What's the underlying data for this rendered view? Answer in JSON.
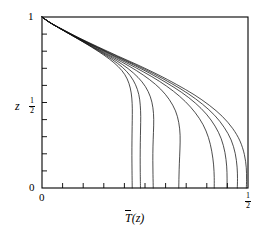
{
  "chart_data": {
    "type": "line",
    "title": "",
    "subtitle": "",
    "xlabel": "T̅(z)",
    "xlabel_parts": {
      "symbol": "T",
      "overbar": true,
      "arg": "(z)"
    },
    "ylabel": "z",
    "xlim": [
      0,
      0.5
    ],
    "ylim": [
      0,
      1
    ],
    "grid": false,
    "legend": false,
    "x_tick_labels": [
      "0",
      "1/2"
    ],
    "x_tick_values": [
      0,
      0.5
    ],
    "y_tick_labels": [
      "0",
      "1/2",
      "1"
    ],
    "y_tick_values": [
      0,
      0.5,
      1
    ],
    "x_minor_tick_count": 10,
    "y_minor_tick_count": 10,
    "series_count": 8,
    "series": [
      {
        "name": "curve-1",
        "x_end": 0.219,
        "points": [
          [
            0.0,
            1.0
          ],
          [
            0.018,
            0.97
          ],
          [
            0.042,
            0.935
          ],
          [
            0.072,
            0.893
          ],
          [
            0.104,
            0.848
          ],
          [
            0.136,
            0.8
          ],
          [
            0.163,
            0.755
          ],
          [
            0.185,
            0.71
          ],
          [
            0.201,
            0.663
          ],
          [
            0.211,
            0.612
          ],
          [
            0.2165,
            0.556
          ],
          [
            0.2188,
            0.495
          ],
          [
            0.2192,
            0.43
          ],
          [
            0.2188,
            0.36
          ],
          [
            0.2184,
            0.28
          ],
          [
            0.2182,
            0.19
          ],
          [
            0.2185,
            0.1
          ],
          [
            0.219,
            0.0
          ]
        ]
      },
      {
        "name": "curve-2",
        "x_end": 0.239,
        "points": [
          [
            0.0,
            1.0
          ],
          [
            0.018,
            0.97
          ],
          [
            0.042,
            0.935
          ],
          [
            0.073,
            0.892
          ],
          [
            0.106,
            0.846
          ],
          [
            0.14,
            0.798
          ],
          [
            0.17,
            0.752
          ],
          [
            0.195,
            0.706
          ],
          [
            0.214,
            0.657
          ],
          [
            0.227,
            0.604
          ],
          [
            0.235,
            0.546
          ],
          [
            0.2385,
            0.484
          ],
          [
            0.2396,
            0.418
          ],
          [
            0.2392,
            0.345
          ],
          [
            0.2386,
            0.265
          ],
          [
            0.2383,
            0.18
          ],
          [
            0.2385,
            0.09
          ],
          [
            0.239,
            0.0
          ]
        ]
      },
      {
        "name": "curve-3",
        "x_end": 0.27,
        "points": [
          [
            0.0,
            1.0
          ],
          [
            0.0185,
            0.969
          ],
          [
            0.043,
            0.934
          ],
          [
            0.075,
            0.89
          ],
          [
            0.11,
            0.843
          ],
          [
            0.146,
            0.794
          ],
          [
            0.18,
            0.746
          ],
          [
            0.209,
            0.698
          ],
          [
            0.233,
            0.647
          ],
          [
            0.251,
            0.593
          ],
          [
            0.263,
            0.533
          ],
          [
            0.2692,
            0.469
          ],
          [
            0.2712,
            0.4
          ],
          [
            0.2705,
            0.325
          ],
          [
            0.2694,
            0.245
          ],
          [
            0.269,
            0.16
          ],
          [
            0.2694,
            0.078
          ],
          [
            0.27,
            0.0
          ]
        ]
      },
      {
        "name": "curve-4",
        "x_end": 0.332,
        "points": [
          [
            0.0,
            1.0
          ],
          [
            0.019,
            0.968
          ],
          [
            0.0445,
            0.932
          ],
          [
            0.078,
            0.887
          ],
          [
            0.115,
            0.839
          ],
          [
            0.154,
            0.788
          ],
          [
            0.193,
            0.738
          ],
          [
            0.229,
            0.687
          ],
          [
            0.261,
            0.634
          ],
          [
            0.288,
            0.578
          ],
          [
            0.309,
            0.517
          ],
          [
            0.324,
            0.451
          ],
          [
            0.332,
            0.382
          ],
          [
            0.3352,
            0.308
          ],
          [
            0.3348,
            0.228
          ],
          [
            0.3334,
            0.145
          ],
          [
            0.3325,
            0.07
          ],
          [
            0.332,
            0.0
          ]
        ]
      },
      {
        "name": "curve-5",
        "x_end": 0.418,
        "points": [
          [
            0.0,
            1.0
          ],
          [
            0.0195,
            0.967
          ],
          [
            0.046,
            0.93
          ],
          [
            0.0815,
            0.884
          ],
          [
            0.121,
            0.835
          ],
          [
            0.163,
            0.783
          ],
          [
            0.206,
            0.731
          ],
          [
            0.247,
            0.678
          ],
          [
            0.285,
            0.624
          ],
          [
            0.319,
            0.566
          ],
          [
            0.348,
            0.505
          ],
          [
            0.372,
            0.44
          ],
          [
            0.391,
            0.37
          ],
          [
            0.404,
            0.295
          ],
          [
            0.412,
            0.215
          ],
          [
            0.4165,
            0.135
          ],
          [
            0.418,
            0.062
          ],
          [
            0.418,
            0.0
          ]
        ]
      },
      {
        "name": "curve-6",
        "x_end": 0.449,
        "points": [
          [
            0.0,
            1.0
          ],
          [
            0.02,
            0.966
          ],
          [
            0.0475,
            0.929
          ],
          [
            0.084,
            0.882
          ],
          [
            0.1255,
            0.832
          ],
          [
            0.17,
            0.779
          ],
          [
            0.216,
            0.727
          ],
          [
            0.26,
            0.673
          ],
          [
            0.301,
            0.617
          ],
          [
            0.339,
            0.559
          ],
          [
            0.372,
            0.497
          ],
          [
            0.399,
            0.432
          ],
          [
            0.42,
            0.362
          ],
          [
            0.435,
            0.288
          ],
          [
            0.444,
            0.208
          ],
          [
            0.4482,
            0.128
          ],
          [
            0.4492,
            0.058
          ],
          [
            0.449,
            0.0
          ]
        ]
      },
      {
        "name": "curve-7",
        "x_end": 0.474,
        "points": [
          [
            0.0,
            1.0
          ],
          [
            0.0205,
            0.965
          ],
          [
            0.049,
            0.928
          ],
          [
            0.087,
            0.88
          ],
          [
            0.13,
            0.829
          ],
          [
            0.1765,
            0.776
          ],
          [
            0.2245,
            0.723
          ],
          [
            0.271,
            0.668
          ],
          [
            0.3145,
            0.611
          ],
          [
            0.3545,
            0.552
          ],
          [
            0.3895,
            0.49
          ],
          [
            0.419,
            0.425
          ],
          [
            0.442,
            0.355
          ],
          [
            0.459,
            0.281
          ],
          [
            0.469,
            0.202
          ],
          [
            0.4735,
            0.122
          ],
          [
            0.4745,
            0.055
          ],
          [
            0.474,
            0.0
          ]
        ]
      },
      {
        "name": "curve-8",
        "x_end": 0.496,
        "points": [
          [
            0.0,
            1.0
          ],
          [
            0.021,
            0.964
          ],
          [
            0.0505,
            0.927
          ],
          [
            0.09,
            0.878
          ],
          [
            0.1345,
            0.827
          ],
          [
            0.183,
            0.773
          ],
          [
            0.233,
            0.719
          ],
          [
            0.2815,
            0.663
          ],
          [
            0.327,
            0.605
          ],
          [
            0.369,
            0.546
          ],
          [
            0.406,
            0.484
          ],
          [
            0.4375,
            0.419
          ],
          [
            0.4625,
            0.349
          ],
          [
            0.4805,
            0.275
          ],
          [
            0.4912,
            0.196
          ],
          [
            0.4958,
            0.118
          ],
          [
            0.4965,
            0.052
          ],
          [
            0.496,
            0.0
          ]
        ]
      }
    ]
  },
  "axes": {
    "y_label": "z",
    "y_top_label": "1",
    "y_mid_label_num": "1",
    "y_mid_label_den": "2",
    "y_bottom_label": "0",
    "x_left_label": "0",
    "x_right_label_num": "1",
    "x_right_label_den": "2",
    "x_title_symbol": "T",
    "x_title_arg": "(z)"
  },
  "colors": {
    "curve": "#111111",
    "axis": "#000000",
    "background": "#ffffff"
  }
}
